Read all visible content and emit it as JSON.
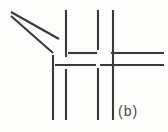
{
  "figure": {
    "label": "(b)",
    "stroke_color": "#3a3a3a",
    "background_color": "#fdfdfb",
    "width": 168,
    "height": 132
  },
  "chart_data": {
    "type": "line-drawing",
    "title": "(b)",
    "xlabel": "",
    "ylabel": "",
    "xlim": [
      0,
      168
    ],
    "ylim": [
      0,
      132
    ],
    "grid": false,
    "legend": "none",
    "annotations": [
      "(b)"
    ],
    "series": [
      {
        "name": "diagonals",
        "type": "segment",
        "stroke_width": 2.1,
        "values": [
          {
            "id": "diag-upper",
            "x1": 11,
            "y1": 12,
            "x2": 59,
            "y2": 39
          },
          {
            "id": "diag-lower",
            "x1": 11,
            "y1": 16,
            "x2": 53,
            "y2": 53
          }
        ]
      },
      {
        "name": "verticals",
        "type": "segment",
        "stroke_width": 2.1,
        "values": [
          {
            "id": "v1-top",
            "x1": 53,
            "y1": 55,
            "x2": 53,
            "y2": 120
          },
          {
            "id": "v2-top",
            "x1": 66,
            "y1": 10,
            "x2": 66,
            "y2": 57
          },
          {
            "id": "v2-bottom",
            "x1": 66,
            "y1": 69,
            "x2": 66,
            "y2": 120
          },
          {
            "id": "v3-top",
            "x1": 98,
            "y1": 10,
            "x2": 98,
            "y2": 50
          },
          {
            "id": "v3-bottom",
            "x1": 98,
            "y1": 68,
            "x2": 98,
            "y2": 120
          },
          {
            "id": "v4-top",
            "x1": 113,
            "y1": 10,
            "x2": 113,
            "y2": 120
          }
        ]
      },
      {
        "name": "horizontals",
        "type": "segment",
        "stroke_width": 2.1,
        "values": [
          {
            "id": "h-upper-left",
            "x1": 68,
            "y1": 53,
            "x2": 97,
            "y2": 53
          },
          {
            "id": "h-upper-right",
            "x1": 111,
            "y1": 53,
            "x2": 164,
            "y2": 53
          },
          {
            "id": "h-lower-left",
            "x1": 55,
            "y1": 65,
            "x2": 96,
            "y2": 65
          },
          {
            "id": "h-lower-right",
            "x1": 100,
            "y1": 65,
            "x2": 164,
            "y2": 65
          }
        ]
      }
    ]
  }
}
